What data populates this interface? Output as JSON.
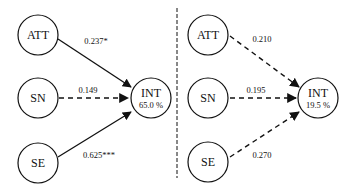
{
  "diagram": {
    "left_panel": {
      "nodes": [
        {
          "id": "ATT",
          "label": "ATT"
        },
        {
          "id": "SN",
          "label": "SN"
        },
        {
          "id": "SE",
          "label": "SE"
        },
        {
          "id": "INT",
          "label": "INT",
          "value": "65.0 %"
        }
      ],
      "edges": [
        {
          "from": "ATT",
          "to": "INT",
          "coef": "0.237*",
          "style": "solid"
        },
        {
          "from": "SN",
          "to": "INT",
          "coef": "0.149",
          "style": "dashed"
        },
        {
          "from": "SE",
          "to": "INT",
          "coef": "0.625***",
          "style": "solid"
        }
      ]
    },
    "right_panel": {
      "nodes": [
        {
          "id": "ATT",
          "label": "ATT"
        },
        {
          "id": "SN",
          "label": "SN"
        },
        {
          "id": "SE",
          "label": "SE"
        },
        {
          "id": "INT",
          "label": "INT",
          "value": "19.5 %"
        }
      ],
      "edges": [
        {
          "from": "ATT",
          "to": "INT",
          "coef": "0.210",
          "style": "dashed"
        },
        {
          "from": "SN",
          "to": "INT",
          "coef": "0.195",
          "style": "dashed"
        },
        {
          "from": "SE",
          "to": "INT",
          "coef": "0.270",
          "style": "dashed"
        }
      ]
    },
    "divider": "dashed-vertical"
  }
}
